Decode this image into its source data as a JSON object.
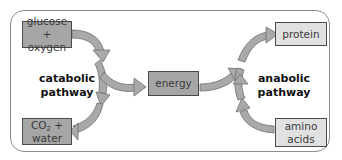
{
  "diagram": {
    "boxes": {
      "glucose_oxygen": {
        "line1": "glucose +",
        "line2": "oxygen",
        "fill": "#a6a6a6"
      },
      "co2_water": {
        "line1_main": "CO",
        "line1_sub": "2",
        "line1_rest": " +",
        "line2": "water",
        "fill": "#a6a6a6"
      },
      "energy": {
        "label": "energy",
        "fill": "#a6a6a6"
      },
      "protein": {
        "label": "protein",
        "fill": "#e1e1e1"
      },
      "amino_acids": {
        "line1": "amino",
        "line2": "acids",
        "fill": "#e1e1e1"
      }
    },
    "labels": {
      "catabolic": {
        "line1": "catabolic",
        "line2": "pathway"
      },
      "anabolic": {
        "line1": "anabolic",
        "line2": "pathway"
      }
    },
    "arrows": [
      {
        "from": "glucose + oxygen",
        "to": "CO2 + water",
        "pathway": "catabolic"
      },
      {
        "from": "catabolic pathway",
        "to": "energy"
      },
      {
        "from": "energy",
        "to": "anabolic pathway"
      },
      {
        "from": "amino acids",
        "to": "protein",
        "pathway": "anabolic"
      }
    ],
    "colors": {
      "arrow_fill": "#a9a9a9",
      "arrow_stroke": "#6e6e6e",
      "frame_border": "#8c8c8c"
    }
  }
}
